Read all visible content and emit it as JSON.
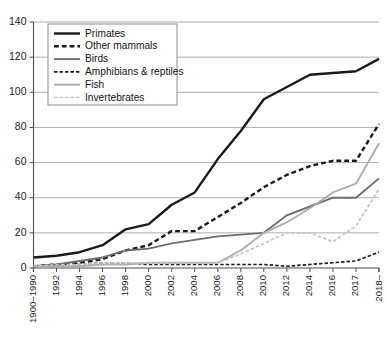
{
  "chart_data": {
    "type": "line",
    "title": "",
    "xlabel": "",
    "ylabel": "",
    "ylim": [
      0,
      140
    ],
    "yticks": [
      0,
      20,
      40,
      60,
      80,
      100,
      120,
      140
    ],
    "grid": true,
    "legend_position": "top-left",
    "categories": [
      "1900–1990",
      "1992",
      "1994",
      "1996",
      "1998",
      "2000",
      "2002",
      "2004",
      "2006",
      "2008",
      "2010",
      "2012",
      "2014",
      "2016",
      "2017",
      "2018–"
    ],
    "series": [
      {
        "name": "Primates",
        "color": "#1a1a1a",
        "style": "solid",
        "width": 2.4,
        "values": [
          6,
          7,
          9,
          13,
          22,
          25,
          36,
          43,
          62,
          78,
          96,
          103,
          110,
          111,
          112,
          119
        ]
      },
      {
        "name": "Other mammals",
        "color": "#1a1a1a",
        "style": "dashed",
        "width": 2.4,
        "values": [
          1,
          2,
          3,
          5,
          10,
          13,
          21,
          21,
          29,
          37,
          46,
          53,
          58,
          61,
          61,
          82
        ]
      },
      {
        "name": "Birds",
        "color": "#6e6e6e",
        "style": "solid",
        "width": 1.9,
        "values": [
          1,
          2,
          4,
          6,
          10,
          11,
          14,
          16,
          18,
          19,
          20,
          30,
          35,
          40,
          40,
          51
        ]
      },
      {
        "name": "Amphibians & reptiles",
        "color": "#1a1a1a",
        "style": "dashed",
        "width": 1.7,
        "values": [
          1,
          2,
          2,
          3,
          3,
          2,
          2,
          2,
          2,
          2,
          2,
          1,
          2,
          3,
          4,
          9
        ]
      },
      {
        "name": "Fish",
        "color": "#adadad",
        "style": "solid",
        "width": 1.9,
        "values": [
          1,
          1,
          1,
          2,
          2,
          3,
          3,
          3,
          3,
          10,
          20,
          26,
          34,
          43,
          48,
          71
        ]
      },
      {
        "name": "Invertebrates",
        "color": "#c4c4c4",
        "style": "dashed",
        "width": 1.7,
        "values": [
          1,
          2,
          2,
          3,
          3,
          3,
          3,
          3,
          3,
          8,
          14,
          20,
          20,
          15,
          24,
          45
        ]
      }
    ]
  },
  "legend": {
    "items": [
      {
        "label": "Primates"
      },
      {
        "label": "Other mammals"
      },
      {
        "label": "Birds"
      },
      {
        "label": "Amphibians & reptiles"
      },
      {
        "label": "Fish"
      },
      {
        "label": "Invertebrates"
      }
    ]
  }
}
